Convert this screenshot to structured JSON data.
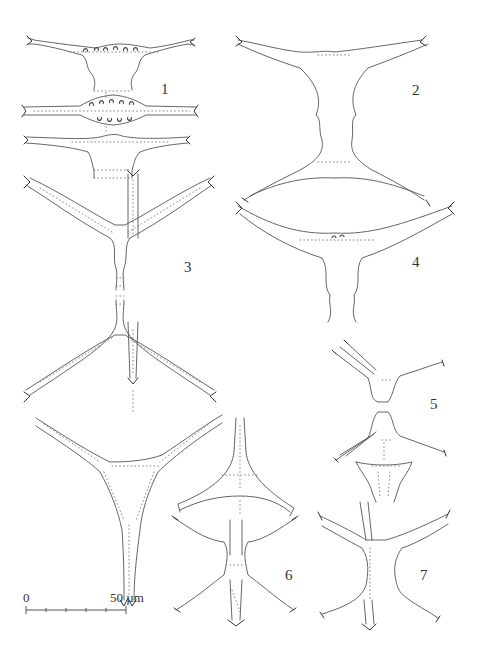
{
  "plate": {
    "figure_labels": [
      {
        "id": "1",
        "text": "1",
        "x": 161,
        "y": 82
      },
      {
        "id": "2",
        "text": "2",
        "x": 412,
        "y": 83
      },
      {
        "id": "3",
        "text": "3",
        "x": 184,
        "y": 260
      },
      {
        "id": "4",
        "text": "4",
        "x": 412,
        "y": 255
      },
      {
        "id": "5",
        "text": "5",
        "x": 430,
        "y": 397
      },
      {
        "id": "6",
        "text": "6",
        "x": 285,
        "y": 568
      },
      {
        "id": "7",
        "text": "7",
        "x": 420,
        "y": 568
      }
    ],
    "scale_bar": {
      "start_label": "0",
      "end_label": "50 µm",
      "ticks": 5
    }
  }
}
